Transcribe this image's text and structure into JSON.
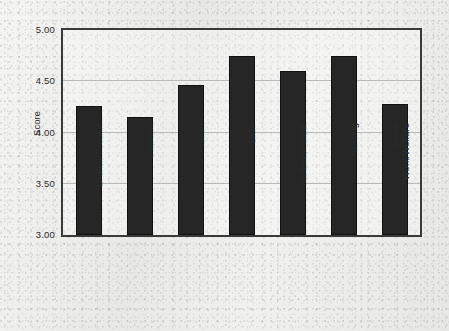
{
  "chart_data": {
    "type": "bar",
    "title": "",
    "xlabel": "",
    "ylabel": "Score",
    "categories": [
      "Drama/Theatre",
      "Classics",
      "Italian",
      "Latin",
      "Medieval Stud.",
      "Nursing",
      "Social Work/Welfare"
    ],
    "values": [
      4.26,
      4.15,
      4.46,
      4.75,
      4.6,
      4.75,
      4.28
    ],
    "ylim": [
      3.0,
      5.0
    ],
    "yticks": [
      "3.00",
      "3.50",
      "4.00",
      "4.50",
      "5.00"
    ],
    "ytick_values": [
      3.0,
      3.5,
      4.0,
      4.5,
      5.0
    ],
    "grid": true,
    "legend": "none",
    "bar_color": "#262626",
    "axis_color": "#3a3a3a",
    "grid_color": "#b9b9b7",
    "background_color": "#e9e9e7"
  }
}
